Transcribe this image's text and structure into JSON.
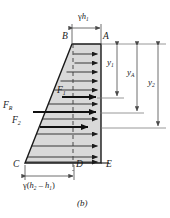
{
  "figure": {
    "caption": "(b)",
    "colors": {
      "fill": "#d9d9d9",
      "outline": "#1a1a1a",
      "arrow": "#1a1a1a",
      "dimension": "#555555",
      "text": "#1a1a1a",
      "background": "#ffffff"
    }
  },
  "points": [
    {
      "id": "A",
      "label": "A",
      "x": 104,
      "y": 38
    },
    {
      "id": "B",
      "label": "B",
      "x": 62,
      "y": 38
    },
    {
      "id": "C",
      "label": "C",
      "x": 14,
      "y": 166
    },
    {
      "id": "D",
      "label": "D",
      "x": 74,
      "y": 166
    },
    {
      "id": "E",
      "label": "E",
      "x": 106,
      "y": 166
    }
  ],
  "forces": [
    {
      "id": "F1",
      "base": "F",
      "sub": "1",
      "x": 57,
      "y": 92,
      "arrow_y": 97,
      "arrow_x1": 60,
      "arrow_x2": 100
    },
    {
      "id": "FR",
      "base": "F",
      "sub": "R",
      "x": 4,
      "y": 108,
      "arrow_y": 112,
      "arrow_x1": 33,
      "arrow_x2": 100
    },
    {
      "id": "F2",
      "base": "F",
      "sub": "2",
      "x": 8,
      "y": 123,
      "arrow_y": 127,
      "arrow_x1": 39,
      "arrow_x2": 100
    }
  ],
  "dimensions": {
    "top": {
      "label_base": "γh",
      "label_sub": "1",
      "text": "γh₁",
      "x1": 72,
      "x2": 101,
      "y": 28,
      "label_x": 78,
      "label_y": 14
    },
    "bottom": {
      "label_base": "γ(h",
      "text": "γ(h₂ - h₁)",
      "x1": 25,
      "x2": 74,
      "y": 176,
      "label_x": 24,
      "label_y": 182
    },
    "vertical": [
      {
        "id": "y1",
        "base": "y",
        "sub": "1",
        "x": 117,
        "y_top": 44,
        "y_bot": 98,
        "label_x": 108,
        "label_y": 64
      },
      {
        "id": "yA",
        "base": "y",
        "sub": "A",
        "x": 137,
        "y_top": 44,
        "y_bot": 113,
        "label_x": 128,
        "label_y": 73
      },
      {
        "id": "y2",
        "base": "y",
        "sub": "2",
        "x": 158,
        "y_top": 44,
        "y_bot": 128,
        "label_x": 148,
        "label_y": 83
      }
    ]
  },
  "shape": {
    "type": "trapezoid",
    "vertices": [
      {
        "name": "B",
        "x": 72,
        "y": 44
      },
      {
        "name": "A",
        "x": 101,
        "y": 44
      },
      {
        "name": "E",
        "x": 101,
        "y": 163
      },
      {
        "name": "C",
        "x": 25,
        "y": 163
      }
    ],
    "centerline": {
      "x": 73,
      "y_top": 44,
      "y_bot": 170,
      "style": "dashed"
    }
  },
  "pressure_arrows_count": 12
}
